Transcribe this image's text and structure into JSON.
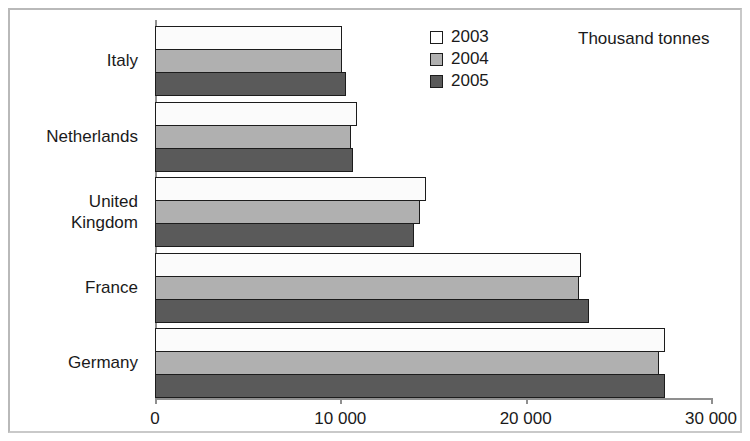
{
  "chart_data": {
    "type": "bar",
    "orientation": "horizontal",
    "title": "",
    "subtitle": "",
    "unit_note": "Thousand tonnes",
    "xlabel": "",
    "ylabel": "",
    "xlim": [
      0,
      30000
    ],
    "grid": false,
    "legend_position": "top-center",
    "categories": [
      "Italy",
      "Netherlands",
      "United\nKingdom",
      "France",
      "Germany"
    ],
    "category_labels_plain": [
      "Italy",
      "Netherlands",
      "United Kingdom",
      "France",
      "Germany"
    ],
    "x_ticks": [
      0,
      10000,
      20000,
      30000
    ],
    "x_tick_labels": [
      "0",
      "10 000",
      "20 000",
      "30 000"
    ],
    "series": [
      {
        "name": "2003",
        "color": "#ffffff",
        "values": [
          10100,
          10900,
          14600,
          23000,
          27500
        ]
      },
      {
        "name": "2004",
        "color": "#b0b0b0",
        "values": [
          10100,
          10600,
          14300,
          22900,
          27200
        ]
      },
      {
        "name": "2005",
        "color": "#5a5a5a",
        "values": [
          10300,
          10700,
          14000,
          23400,
          27500
        ]
      }
    ]
  },
  "legend": {
    "entries": [
      {
        "label": "2003",
        "swatch": "white-swatch"
      },
      {
        "label": "2004",
        "swatch": "light-gray-swatch"
      },
      {
        "label": "2005",
        "swatch": "dark-gray-swatch"
      }
    ]
  },
  "colors": {
    "series_2003": "#ffffff",
    "series_2004": "#b0b0b0",
    "series_2005": "#5a5a5a",
    "bar_outline": "#1c1c1c",
    "axis": "#8f8f8f",
    "frame": "#b9b9b9",
    "background": "#ffffff",
    "text": "#1a1a1a"
  }
}
